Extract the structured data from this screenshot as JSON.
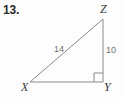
{
  "figure": {
    "problem_number": "13.",
    "background_color": "#fdfdfd",
    "stroke_color": "#8a8a8a",
    "vertex_label_color": "#3a3a3a",
    "side_label_color": "#6f6f6f",
    "number_color": "#2b2b2b",
    "shape": "right triangle",
    "vertices": [
      {
        "name": "X",
        "label": "X",
        "x": 30,
        "y": 82
      },
      {
        "name": "Y",
        "label": "Y",
        "x": 103,
        "y": 82
      },
      {
        "name": "Z",
        "label": "Z",
        "x": 103,
        "y": 19
      }
    ],
    "sides": [
      {
        "name": "hypotenuse-xz",
        "label": "14",
        "from": "X",
        "to": "Z"
      },
      {
        "name": "leg-zy",
        "label": "10",
        "from": "Z",
        "to": "Y"
      },
      {
        "name": "leg-xy",
        "label": "",
        "from": "X",
        "to": "Y"
      }
    ],
    "right_angle": {
      "at_vertex": "Y",
      "marker": "square",
      "size": 9
    },
    "polygon_points": "30,82 103,82 103,19",
    "right_angle_path": "M 94,82 L 94,73 L 103,73"
  }
}
